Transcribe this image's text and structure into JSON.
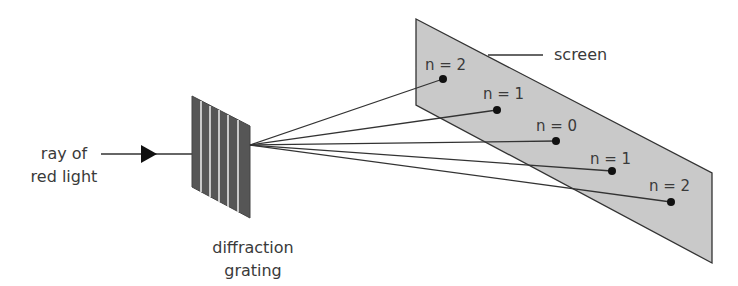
{
  "diagram": {
    "source_label": {
      "line1": "ray of",
      "line2": "red light"
    },
    "grating_label": {
      "line1": "diffraction",
      "line2": "grating"
    },
    "screen_label": "screen",
    "orders": [
      {
        "label": "n = 2",
        "position": "upper"
      },
      {
        "label": "n = 1",
        "position": "upper"
      },
      {
        "label": "n = 0",
        "position": "center"
      },
      {
        "label": "n = 1",
        "position": "lower"
      },
      {
        "label": "n = 2",
        "position": "lower"
      }
    ],
    "colors": {
      "line": "#333333",
      "screen_fill": "#c9c9c9",
      "grating_fill": "#565656",
      "grating_slits": "#e6e6e6",
      "text": "#3a3a3a"
    }
  }
}
